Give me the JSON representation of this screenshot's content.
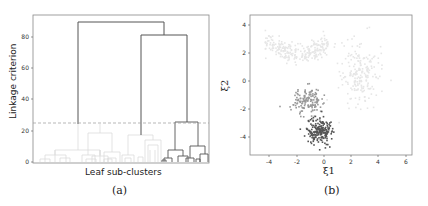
{
  "figure": {
    "panel_a": {
      "caption": "(a)",
      "xlabel": "Leaf sub-clusters",
      "ylabel": "Linkage criterion",
      "yticks": [
        "0",
        "20",
        "40",
        "60",
        "80"
      ]
    },
    "panel_b": {
      "caption": "(b)",
      "xlabel": "ξ1",
      "ylabel": "ξ2",
      "xticks": [
        "-4",
        "-2",
        "0",
        "2",
        "4",
        "6"
      ],
      "yticks": [
        "-4",
        "-2",
        "0",
        "2",
        "4"
      ]
    }
  },
  "chart_data": [
    {
      "type": "dendrogram",
      "title": "",
      "xlabel": "Leaf sub-clusters",
      "ylabel": "Linkage criterion",
      "ylim": [
        0,
        95
      ],
      "yticks": [
        0,
        20,
        40,
        60,
        80
      ],
      "threshold_line": {
        "y": 25,
        "style": "dashed",
        "color": "#999999"
      },
      "merges": [
        {
          "height": 90,
          "description": "root merge of left group and right group",
          "color": "#555555"
        },
        {
          "height": 81,
          "description": "merge of middle group and dark subtree",
          "color": "#555555"
        },
        {
          "height": 26,
          "description": "merge of two dark sub-clusters",
          "color": "#444444"
        },
        {
          "height": 24,
          "description": "left light group root",
          "color": "#dddddd"
        },
        {
          "height": 17.5,
          "description": "middle light group root",
          "color": "#dddddd"
        },
        {
          "height": 19,
          "description": "left-middle light group root",
          "color": "#dddddd"
        },
        {
          "height": 7,
          "description": "dark sub-cluster A",
          "color": "#666666"
        },
        {
          "height": 8,
          "description": "dark sub-cluster B",
          "color": "#666666"
        }
      ],
      "colors": {
        "above_threshold": "#555555",
        "below_threshold_light": "#dddddd",
        "dark_cluster": "#555555"
      }
    },
    {
      "type": "scatter",
      "title": "",
      "xlabel": "ξ1",
      "ylabel": "ξ2",
      "xlim": [
        -5.4,
        6.4
      ],
      "ylim": [
        -5.2,
        4.7
      ],
      "xticks": [
        -4,
        -2,
        0,
        2,
        4,
        6
      ],
      "yticks": [
        -4,
        -2,
        0,
        2,
        4
      ],
      "series": [
        {
          "name": "cluster_arc",
          "color": "#e6e6e6",
          "center": [
            -2,
            2.5
          ],
          "shape": "arc",
          "extent": {
            "x": [
              -4.5,
              0.5
            ],
            "y": [
              1,
              4.2
            ]
          },
          "approx_points": 250
        },
        {
          "name": "cluster_right",
          "color": "#e6e6e6",
          "center": [
            2.6,
            0.5
          ],
          "spread": [
            0.7,
            1.2
          ],
          "approx_points": 200
        },
        {
          "name": "cluster_mid",
          "color": "#999999",
          "center": [
            -1.2,
            -1.4
          ],
          "spread": [
            0.5,
            0.5
          ],
          "approx_points": 150
        },
        {
          "name": "cluster_dark",
          "color": "#555555",
          "center": [
            -0.3,
            -3.6
          ],
          "spread": [
            0.5,
            0.45
          ],
          "approx_points": 200
        }
      ]
    }
  ]
}
